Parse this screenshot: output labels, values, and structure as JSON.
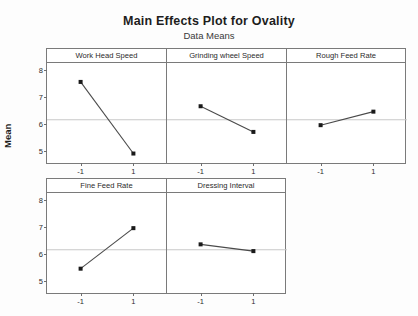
{
  "chart_data": {
    "type": "line",
    "title": "Main Effects Plot for Ovality",
    "subtitle": "Data Means",
    "ylabel": "Mean",
    "xlabel": "",
    "x": [
      -1,
      1
    ],
    "xtick_labels": [
      "-1",
      "1"
    ],
    "ylim": [
      4.6,
      8.3
    ],
    "ytick_labels": [
      "8",
      "7",
      "6",
      "5"
    ],
    "ytick_values": [
      8,
      7,
      6,
      5
    ],
    "grid": false,
    "reference_line": 6.2,
    "legend": "none",
    "layout": {
      "rows": 2,
      "cols": 3
    },
    "panels": [
      {
        "name": "Work Head Speed",
        "categories": [
          "-1",
          "1"
        ],
        "values": [
          7.6,
          4.95
        ],
        "row": 0
      },
      {
        "name": "Grinding wheel Speed",
        "categories": [
          "-1",
          "1"
        ],
        "values": [
          6.7,
          5.75
        ],
        "row": 0
      },
      {
        "name": "Rough Feed Rate",
        "categories": [
          "-1",
          "1"
        ],
        "values": [
          6.0,
          6.5
        ],
        "row": 0
      },
      {
        "name": "Fine Feed Rate",
        "categories": [
          "-1",
          "1"
        ],
        "values": [
          5.5,
          7.0
        ],
        "row": 1
      },
      {
        "name": "Dressing Interval",
        "categories": [
          "-1",
          "1"
        ],
        "values": [
          6.4,
          6.15
        ],
        "row": 1
      }
    ],
    "colors": {
      "line": "#4a4a4a",
      "marker": "#1a1a1a",
      "frame": "#7a7a7a",
      "reference": "#c8c8c8",
      "background": "#ffffff"
    }
  }
}
